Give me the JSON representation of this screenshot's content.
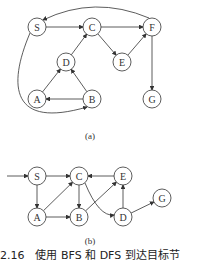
{
  "graph_a": {
    "caption": "(a)",
    "nodes": [
      {
        "id": "S",
        "x": 37,
        "y": 27
      },
      {
        "id": "C",
        "x": 92,
        "y": 27
      },
      {
        "id": "F",
        "x": 152,
        "y": 27
      },
      {
        "id": "D",
        "x": 66,
        "y": 62
      },
      {
        "id": "E",
        "x": 122,
        "y": 62
      },
      {
        "id": "A",
        "x": 37,
        "y": 99
      },
      {
        "id": "B",
        "x": 92,
        "y": 99
      },
      {
        "id": "G",
        "x": 152,
        "y": 99
      }
    ],
    "edges": [
      [
        "S",
        "C"
      ],
      [
        "C",
        "F"
      ],
      [
        "C",
        "E"
      ],
      [
        "E",
        "F"
      ],
      [
        "D",
        "C"
      ],
      [
        "A",
        "D"
      ],
      [
        "B",
        "D"
      ],
      [
        "B",
        "A"
      ],
      [
        "F",
        "G"
      ],
      [
        "F",
        "S",
        "curve-top"
      ],
      [
        "S",
        "B",
        "curve-left"
      ]
    ]
  },
  "graph_b": {
    "caption": "(b)",
    "nodes": [
      {
        "id": "S",
        "x": 37,
        "y": 176
      },
      {
        "id": "C",
        "x": 79,
        "y": 176
      },
      {
        "id": "E",
        "x": 123,
        "y": 176
      },
      {
        "id": "A",
        "x": 37,
        "y": 217
      },
      {
        "id": "B",
        "x": 79,
        "y": 217
      },
      {
        "id": "D",
        "x": 123,
        "y": 217
      },
      {
        "id": "G",
        "x": 162,
        "y": 198
      }
    ],
    "edges": [
      [
        "start",
        "S"
      ],
      [
        "S",
        "C"
      ],
      [
        "S",
        "A"
      ],
      [
        "A",
        "C"
      ],
      [
        "A",
        "B"
      ],
      [
        "C",
        "B"
      ],
      [
        "B",
        "E"
      ],
      [
        "E",
        "C"
      ],
      [
        "C",
        "D",
        "curve"
      ],
      [
        "D",
        "E"
      ],
      [
        "D",
        "G"
      ]
    ]
  },
  "figure_caption": "2.16　使用 BFS 和 DFS 到达目标节"
}
